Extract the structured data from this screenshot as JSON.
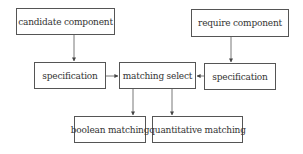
{
  "diagram": {
    "type": "flowchart",
    "nodes": {
      "candidate": "candidate component",
      "require": "require component",
      "spec_left": "specification",
      "matching": "matching select",
      "spec_right": "specification",
      "boolean": "boolean matching",
      "quantitative": "quantitative matching"
    },
    "edges": [
      {
        "from": "candidate component",
        "to": "specification (left)"
      },
      {
        "from": "require component",
        "to": "specification (right)"
      },
      {
        "from": "specification (left)",
        "to": "matching select"
      },
      {
        "from": "specification (right)",
        "to": "matching select"
      },
      {
        "from": "matching select",
        "to": "boolean matching"
      },
      {
        "from": "matching select",
        "to": "quantitative matching"
      }
    ]
  }
}
